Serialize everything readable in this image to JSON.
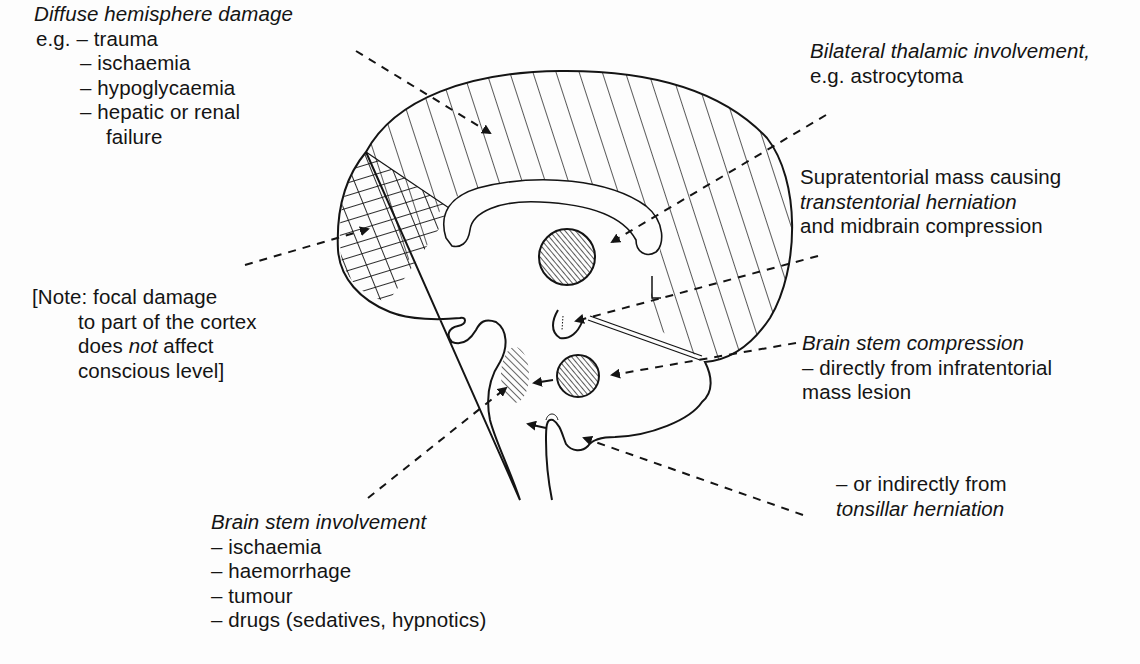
{
  "labels": {
    "diffuse": {
      "title": "Diffuse hemisphere damage",
      "prefix": "e.g. ",
      "items": [
        "– trauma",
        "– ischaemia",
        "– hypoglycaemia",
        "– hepatic or renal",
        "failure"
      ]
    },
    "thalamic": {
      "title": "Bilateral thalamic involvement,",
      "example": "e.g. astrocytoma"
    },
    "supratentorial": {
      "line1": "Supratentorial mass causing",
      "line2": "transtentorial herniation",
      "line3": "and midbrain compression"
    },
    "note": {
      "line1": "[Note: focal damage",
      "line2": "to part of the cortex",
      "line3_pre": "does ",
      "line3_em": "not",
      "line3_post": " affect",
      "line4": "conscious level]"
    },
    "compression": {
      "title": "Brain stem compression",
      "line1": "– directly from infratentorial",
      "line2": "mass lesion"
    },
    "tonsillar": {
      "line1": "– or indirectly from",
      "line2": "tonsillar herniation"
    },
    "involvement": {
      "title": "Brain stem involvement",
      "items": [
        "– ischaemia",
        "– haemorrhage",
        "– tumour",
        "– drugs (sedatives, hypnotics)"
      ]
    }
  },
  "colors": {
    "ink": "#141414",
    "paper": "#fdfdfd"
  }
}
